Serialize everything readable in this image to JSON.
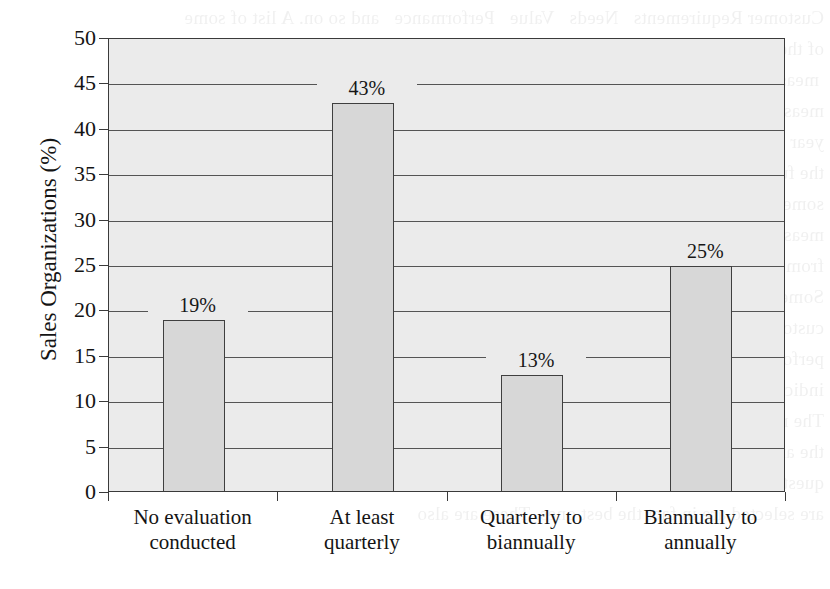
{
  "figure": {
    "background_color": "#ffffff",
    "plot_background_color": "#ebebeb",
    "bar_fill_color": "#d7d7d7",
    "bar_outline_color": "#3f3f3f",
    "gridline_color": "#545454",
    "axis_color": "#3a3a3a"
  },
  "bleed_text": "Customer Requirements   Needs   Value   Performance   and so on. A list of some\nof these is illustrated in the above table. In 10-15\n measurements  are likely to be the same. Over time\nmeasures are likely to change and this comparison\nyear performance may be compared to this years per\nthe future may be expected to show improvement.\nsome of the metrics that are used to measure sales\nmeasures typically found in this category are those\nfrom the customer relationship management system.\nSome organizations use a balanced scorecard with\ncustomer data. If a company evaluates its sales force\nperformance according to one of these measures it\nindicates a willingness to act on the basis of fact.\nThe results of such analyses tend to be objective and\nthe analysis itself is relatively easy to repeat. The\nquestion then becomes whether the measures that\nare selected are in fact the best ones. These are also",
  "chart_data": {
    "type": "bar",
    "title": "",
    "xlabel": "",
    "ylabel": "Sales Organizations (%)",
    "ylim": [
      0,
      50
    ],
    "yticks": [
      0,
      5,
      10,
      15,
      20,
      25,
      30,
      35,
      40,
      45,
      50
    ],
    "ytick_labels": [
      "0",
      "5",
      "10",
      "15",
      "20",
      "25",
      "30",
      "35",
      "40",
      "45",
      "50"
    ],
    "grid": true,
    "legend": "none",
    "categories": [
      [
        "No evaluation",
        "conducted"
      ],
      [
        "At least",
        "quarterly"
      ],
      [
        "Quarterly to",
        "biannually"
      ],
      [
        "Biannually to",
        "annually"
      ]
    ],
    "values": [
      19,
      43,
      13,
      25
    ],
    "value_labels": [
      "19%",
      "43%",
      "13%",
      "25%"
    ]
  }
}
